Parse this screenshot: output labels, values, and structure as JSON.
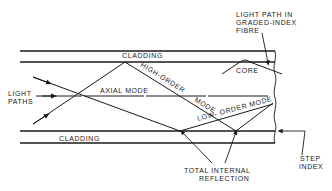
{
  "diagram": {
    "labels": {
      "cladding_top": "CLADDING",
      "cladding_bottom": "CLADDING",
      "core": "CORE",
      "light_paths_1": "LIGHT",
      "light_paths_2": "PATHS",
      "axial_mode": "AXIAL MODE",
      "high_order_mode_1": "HIGH-ORDER",
      "high_order_mode_2": "MODE",
      "low_order_mode": "LOW- ORDER MODE",
      "graded_index_1": "LIGHT PATH IN",
      "graded_index_2": "GRADED-INDEX",
      "graded_index_3": "FIBRE",
      "tir_1": "TOTAL INTERNAL",
      "tir_2": "REFLECTION",
      "step_index_1": "STEP",
      "step_index_2": "INDEX"
    },
    "colors": {
      "ink": "#1a1a1a",
      "background": "#ffffff"
    }
  }
}
